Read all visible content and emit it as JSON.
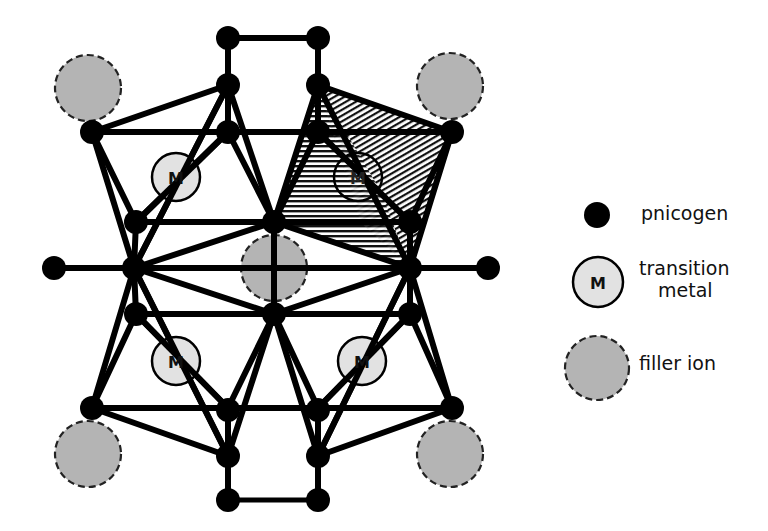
{
  "diagram": {
    "type": "crystal-structure",
    "colors": {
      "bond": "#000000",
      "pnicogen": "#000000",
      "transition_metal_fill": "#e2e2e2",
      "filler_fill": "#b4b4b4",
      "filler_outline": "#222222",
      "hatch": "#000000"
    },
    "metal_label": "M"
  },
  "legend": {
    "items": [
      {
        "symbol": "pnicogen-dot",
        "label": "pnicogen"
      },
      {
        "symbol": "transition-metal-circle",
        "symbol_text": "M",
        "label_line1": "transition",
        "label_line2": "metal"
      },
      {
        "symbol": "filler-ion-circle",
        "label": "filler ion"
      }
    ]
  }
}
